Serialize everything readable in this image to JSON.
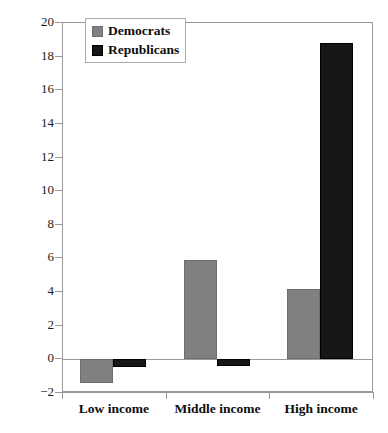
{
  "chart_data": {
    "type": "bar",
    "title": "",
    "xlabel": "",
    "ylabel": "Responsiveness (regression estimate)",
    "categories": [
      "Low income",
      "Middle income",
      "High income"
    ],
    "series": [
      {
        "name": "Democrats",
        "color": "#808080",
        "values": [
          -1.4,
          5.9,
          4.2
        ]
      },
      {
        "name": "Republicans",
        "color": "#161616",
        "values": [
          -0.45,
          -0.4,
          18.8
        ]
      }
    ],
    "ylim": [
      -2,
      20
    ],
    "ytick_step": 2,
    "yticks": [
      20,
      18,
      16,
      14,
      12,
      10,
      8,
      6,
      4,
      2,
      0,
      -2
    ],
    "ytick_labels": [
      "20",
      "18",
      "16",
      "14",
      "12",
      "10",
      "8",
      "6",
      "4",
      "2",
      "0",
      "−2"
    ],
    "grid": false,
    "legend_position": "top-left",
    "legend_entries": [
      "Democrats",
      "Republicans"
    ]
  }
}
